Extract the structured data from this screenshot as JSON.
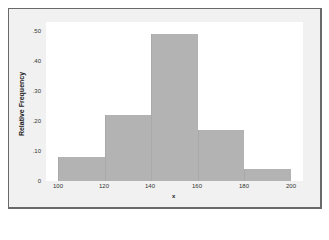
{
  "chart_data": {
    "type": "bar",
    "subtype": "histogram",
    "title": "",
    "xlabel": "x",
    "ylabel": "Relative Frequency",
    "bins": [
      [
        100,
        120
      ],
      [
        120,
        140
      ],
      [
        140,
        160
      ],
      [
        160,
        180
      ],
      [
        180,
        200
      ]
    ],
    "categories": [
      "100-120",
      "120-140",
      "140-160",
      "160-180",
      "180-200"
    ],
    "values": [
      0.08,
      0.22,
      0.49,
      0.17,
      0.04
    ],
    "x_ticks": [
      "100",
      "120",
      "140",
      "160",
      "180",
      "200"
    ],
    "y_ticks": [
      "0",
      ".10",
      ".20",
      ".30",
      ".40",
      ".50"
    ],
    "xlim": [
      100,
      200
    ],
    "ylim": [
      0,
      0.5
    ],
    "grid": false,
    "legend": null,
    "colors": {
      "bar": "#b3b3b3",
      "frame_bg": "#f1f1f1",
      "plot_bg": "#ffffff",
      "border": "#6a6a6a"
    }
  }
}
